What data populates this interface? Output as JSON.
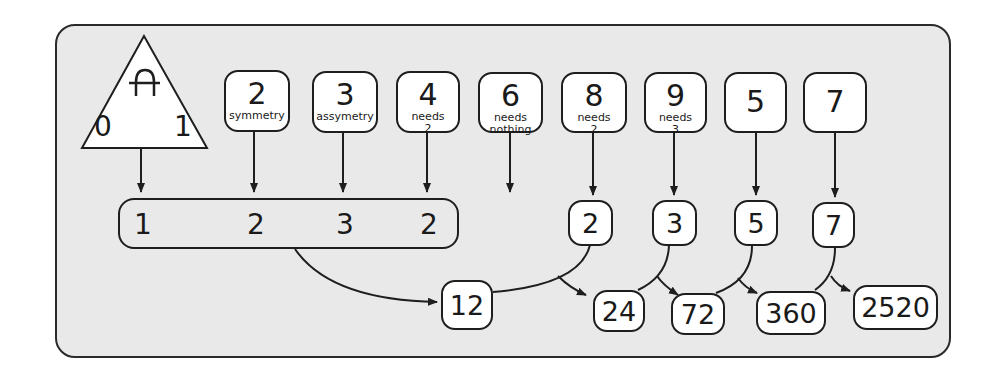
{
  "diagram": {
    "triangle": {
      "symbol": "A-bar-glyph",
      "left_value": "0",
      "right_value": "1",
      "output": "1"
    },
    "top_boxes": [
      {
        "number": "2",
        "note_line1": "symmetry",
        "note_line2": ""
      },
      {
        "number": "3",
        "note_line1": "assymetry",
        "note_line2": ""
      },
      {
        "number": "4",
        "note_line1": "needs",
        "note_line2": "2"
      },
      {
        "number": "6",
        "note_line1": "needs",
        "note_line2": "nothing"
      },
      {
        "number": "8",
        "note_line1": "needs",
        "note_line2": "2"
      },
      {
        "number": "9",
        "note_line1": "needs",
        "note_line2": "3"
      },
      {
        "number": "5",
        "note_line1": "",
        "note_line2": ""
      },
      {
        "number": "7",
        "note_line1": "",
        "note_line2": ""
      }
    ],
    "group_values": [
      "1",
      "2",
      "3",
      "2"
    ],
    "factor_boxes": [
      "2",
      "3",
      "5",
      "7"
    ],
    "products": [
      "12",
      "24",
      "72",
      "360",
      "2520"
    ],
    "colors": {
      "panel_bg": "#e9e9e9",
      "stroke": "#1e1e1e",
      "box_fill": "#ffffff"
    }
  }
}
